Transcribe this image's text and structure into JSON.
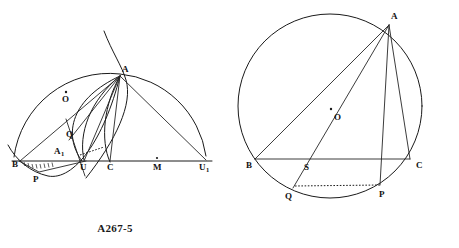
{
  "page": {
    "background_color": "#ffffff",
    "ink_color": "#1a1a1a",
    "width": 459,
    "height": 248
  },
  "figures": [
    {
      "id": "figure-left",
      "caption": "A267-5",
      "description": "Semicircle on diameter B-U1 with apex A; chords and arcs meeting at A; baseline points B, A1, U, C, M, U1; points P, Q and center mark O",
      "points": [
        {
          "name": "B",
          "label": "B",
          "x": 18,
          "y": 161
        },
        {
          "name": "P",
          "label": "P",
          "x": 37,
          "y": 174
        },
        {
          "name": "A1",
          "label": "A",
          "sub": "1",
          "x": 59,
          "y": 151
        },
        {
          "name": "Q",
          "label": "Q",
          "x": 70,
          "y": 134
        },
        {
          "name": "U",
          "label": "U",
          "x": 84,
          "y": 161
        },
        {
          "name": "C",
          "label": "C",
          "x": 110,
          "y": 161
        },
        {
          "name": "M",
          "label": "M",
          "x": 157,
          "y": 161
        },
        {
          "name": "U1",
          "label": "U",
          "sub": "1",
          "x": 203,
          "y": 161
        },
        {
          "name": "A",
          "label": "A",
          "x": 120,
          "y": 74
        },
        {
          "name": "O",
          "label": "O",
          "x": 66,
          "y": 99
        }
      ],
      "baseline": {
        "from": "B",
        "to": "U1"
      }
    },
    {
      "id": "figure-right",
      "caption": "A-626",
      "description": "Circle with center O, inscribed triangle ABC, cevians from A to Q and P, chord BC with point S, dotted chord Q-P",
      "circle": {
        "center_x": 100,
        "center_y": 106,
        "radius": 92
      },
      "points": [
        {
          "name": "A",
          "label": "A",
          "x": 161,
          "y": 21
        },
        {
          "name": "O",
          "label": "O",
          "x": 104,
          "y": 117
        },
        {
          "name": "B",
          "label": "B",
          "x": 28,
          "y": 162
        },
        {
          "name": "S",
          "label": "S",
          "x": 77,
          "y": 167
        },
        {
          "name": "C",
          "label": "C",
          "x": 180,
          "y": 163
        },
        {
          "name": "Q",
          "label": "Q",
          "x": 60,
          "y": 194
        },
        {
          "name": "P",
          "label": "P",
          "x": 152,
          "y": 191
        }
      ]
    }
  ]
}
